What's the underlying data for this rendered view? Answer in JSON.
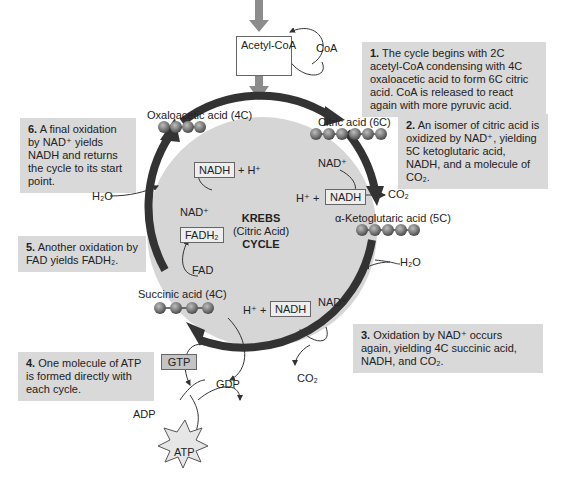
{
  "acetyl": {
    "label": "Acetyl-CoA",
    "coa": "CoA"
  },
  "center": {
    "line1": "KREBS",
    "line2": "(Citric Acid)",
    "line3": "CYCLE"
  },
  "molecules": {
    "oxaloacetic": "Oxaloacetic acid (4C)",
    "citric": "Citric acid (6C)",
    "ketoglutaric": "α-Ketoglutaric acid (5C)",
    "succinic": "Succinic acid (4C)"
  },
  "notes": [
    {
      "num": "1.",
      "text": "The cycle begins with 2C acetyl-CoA condensing with 4C oxaloacetic acid to form 6C citric acid. CoA is released to react again with more pyruvic acid."
    },
    {
      "num": "2.",
      "text": "An isomer of citric acid is oxidized by NAD⁺, yielding 5C ketoglutaric acid, NADH, and a molecule of CO₂."
    },
    {
      "num": "3.",
      "text": "Oxidation by NAD⁺ occurs again, yielding 4C succinic acid, NADH, and CO₂."
    },
    {
      "num": "4.",
      "text": "One molecule of ATP is formed directly with each cycle."
    },
    {
      "num": "5.",
      "text": "Another oxidation by FAD yields FADH₂."
    },
    {
      "num": "6.",
      "text": "A final oxidation by NAD⁺ yields NADH and returns the cycle to its start point."
    }
  ],
  "labels": {
    "nadh": "NADH",
    "nad_plus": "NAD⁺",
    "h_plus_pre": "H⁺ +",
    "plus_h_post": "+ H⁺",
    "co2": "CO₂",
    "h2o": "H₂O",
    "fadh2": "FADH₂",
    "fad": "FAD",
    "gtp": "GTP",
    "gdp": "GDP",
    "adp": "ADP",
    "atp": "ATP"
  },
  "colors": {
    "cycle_fill": "#d6d6d6",
    "arrow": "#333333",
    "note_bg": "#d9d9d9",
    "bead": "#7a7a7a",
    "feed_arrow": "#8c8c8c"
  }
}
